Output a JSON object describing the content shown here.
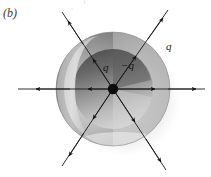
{
  "figure": {
    "panel_label": "(b)",
    "caption_labels": {
      "inner_charge": "q",
      "cavity_charge": "−q",
      "shell_charge": "q"
    },
    "colors": {
      "background": "#ffffff",
      "shell_dark": "#6f6f6f",
      "shell_mid": "#9a9a9a",
      "shell_light": "#d8d8d8",
      "cavity_shadow": "#5a5a5a",
      "cavity_light": "#c9c9c9",
      "highlight": "#f2f2f2",
      "drop_shadow": "#e8e8e8",
      "line": "#1a1a1a",
      "point_charge": "#0d0d0d",
      "text": "#1a1a1a"
    },
    "geometry": {
      "center_x": 113,
      "center_y": 89,
      "sphere_radius": 57,
      "cavity_radius": 40,
      "point_charge_radius": 5
    },
    "field_lines": [
      {
        "name": "field-line-left",
        "direction": "left",
        "angle_deg": 180
      },
      {
        "name": "field-line-right",
        "direction": "right",
        "angle_deg": 0
      },
      {
        "name": "field-line-upper-left",
        "direction": "up-left",
        "angle_deg": 145
      },
      {
        "name": "field-line-upper-right",
        "direction": "up-right",
        "angle_deg": 35
      },
      {
        "name": "field-line-lower-left",
        "direction": "down-left",
        "angle_deg": 215
      },
      {
        "name": "field-line-lower-right",
        "direction": "down-right",
        "angle_deg": 325
      }
    ],
    "arrow_count": 12,
    "description_type": "conducting-spherical-shell-cutaway"
  }
}
